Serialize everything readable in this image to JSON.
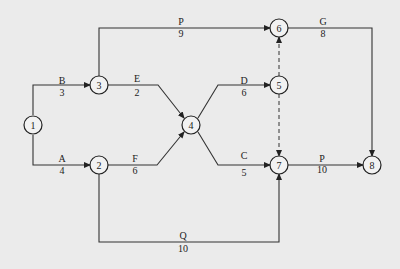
{
  "diagram": {
    "type": "activity-on-arrow network",
    "nodes": [
      {
        "id": "1",
        "label": "1",
        "x": 33,
        "y": 125
      },
      {
        "id": "2",
        "label": "2",
        "x": 99,
        "y": 165
      },
      {
        "id": "3",
        "label": "3",
        "x": 99,
        "y": 85
      },
      {
        "id": "4",
        "label": "4",
        "x": 191,
        "y": 125
      },
      {
        "id": "5",
        "label": "5",
        "x": 279,
        "y": 85
      },
      {
        "id": "6",
        "label": "6",
        "x": 279,
        "y": 28
      },
      {
        "id": "7",
        "label": "7",
        "x": 279,
        "y": 165
      },
      {
        "id": "8",
        "label": "8",
        "x": 372,
        "y": 165
      }
    ],
    "edges": [
      {
        "from": "1",
        "to": "3",
        "name": "B",
        "duration": "3",
        "name_x": 62,
        "name_y": 84,
        "dur_x": 62,
        "dur_y": 96
      },
      {
        "from": "1",
        "to": "2",
        "name": "A",
        "duration": "4",
        "name_x": 62,
        "name_y": 162,
        "dur_x": 62,
        "dur_y": 174
      },
      {
        "from": "3",
        "to": "6",
        "name": "P",
        "duration": "9",
        "name_x": 181,
        "name_y": 25,
        "dur_x": 181,
        "dur_y": 37
      },
      {
        "from": "3",
        "to": "4",
        "name": "E",
        "duration": "2",
        "name_x": 137,
        "name_y": 84,
        "dur_x": 137,
        "dur_y": 96
      },
      {
        "from": "2",
        "to": "4",
        "name": "F",
        "duration": "6",
        "name_x": 135,
        "name_y": 162,
        "dur_x": 135,
        "dur_y": 174
      },
      {
        "from": "2",
        "to": "7",
        "name": "Q",
        "duration": "10",
        "name_x": 183,
        "name_y": 240,
        "dur_x": 183,
        "dur_y": 252
      },
      {
        "from": "4",
        "to": "5",
        "name": "D",
        "duration": "6",
        "name_x": 244,
        "name_y": 84,
        "dur_x": 244,
        "dur_y": 96
      },
      {
        "from": "4",
        "to": "7",
        "name": "C",
        "duration": "5",
        "name_x": 244,
        "name_y": 159,
        "dur_x": 244,
        "dur_y": 176
      },
      {
        "from": "5",
        "to": "6",
        "name": "",
        "duration": "",
        "dummy": true
      },
      {
        "from": "5",
        "to": "7",
        "name": "",
        "duration": "",
        "dummy": true
      },
      {
        "from": "6",
        "to": "8",
        "name": "G",
        "duration": "8",
        "name_x": 323,
        "name_y": 25,
        "dur_x": 323,
        "dur_y": 37
      },
      {
        "from": "7",
        "to": "8",
        "name": "P",
        "duration": "10",
        "name_x": 322,
        "name_y": 162,
        "dur_x": 322,
        "dur_y": 174
      }
    ]
  }
}
